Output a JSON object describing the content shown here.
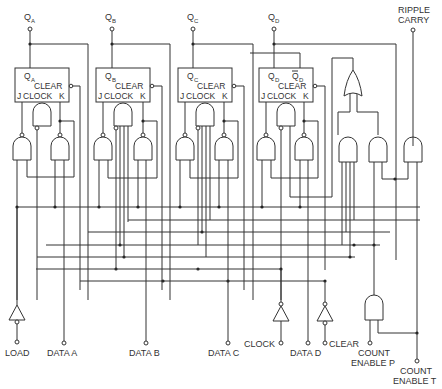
{
  "diagram": {
    "type": "logic-schematic",
    "outputs": [
      {
        "main": "Q",
        "sub": "A"
      },
      {
        "main": "Q",
        "sub": "B"
      },
      {
        "main": "Q",
        "sub": "C"
      },
      {
        "main": "Q",
        "sub": "D"
      }
    ],
    "ripple_carry": {
      "line1": "RIPPLE",
      "line2": "CARRY"
    },
    "flipflops": [
      {
        "q_main": "Q",
        "q_sub": "A",
        "clear": "CLEAR",
        "j": "J",
        "clock": "CLOCK",
        "k": "K"
      },
      {
        "q_main": "Q",
        "q_sub": "B",
        "clear": "CLEAR",
        "j": "J",
        "clock": "CLOCK",
        "k": "K"
      },
      {
        "q_main": "Q",
        "q_sub": "C",
        "clear": "CLEAR",
        "j": "J",
        "clock": "CLOCK",
        "k": "K"
      },
      {
        "q_main": "Q",
        "q_sub": "D",
        "qbar_main": "Q",
        "qbar_sub": "D",
        "clear": "CLEAR",
        "j": "J",
        "clock": "CLOCK",
        "k": "K"
      }
    ],
    "inputs": {
      "load": "LOAD",
      "data_a": "DATA A",
      "data_b": "DATA B",
      "data_c": "DATA C",
      "data_d": "DATA D",
      "clock": "CLOCK",
      "clear": "CLEAR",
      "count_enable_p": {
        "line1": "COUNT",
        "line2": "ENABLE P"
      },
      "count_enable_t": {
        "line1": "COUNT",
        "line2": "ENABLE T"
      }
    },
    "colors": {
      "line": "#333333",
      "background": "#ffffff"
    }
  }
}
